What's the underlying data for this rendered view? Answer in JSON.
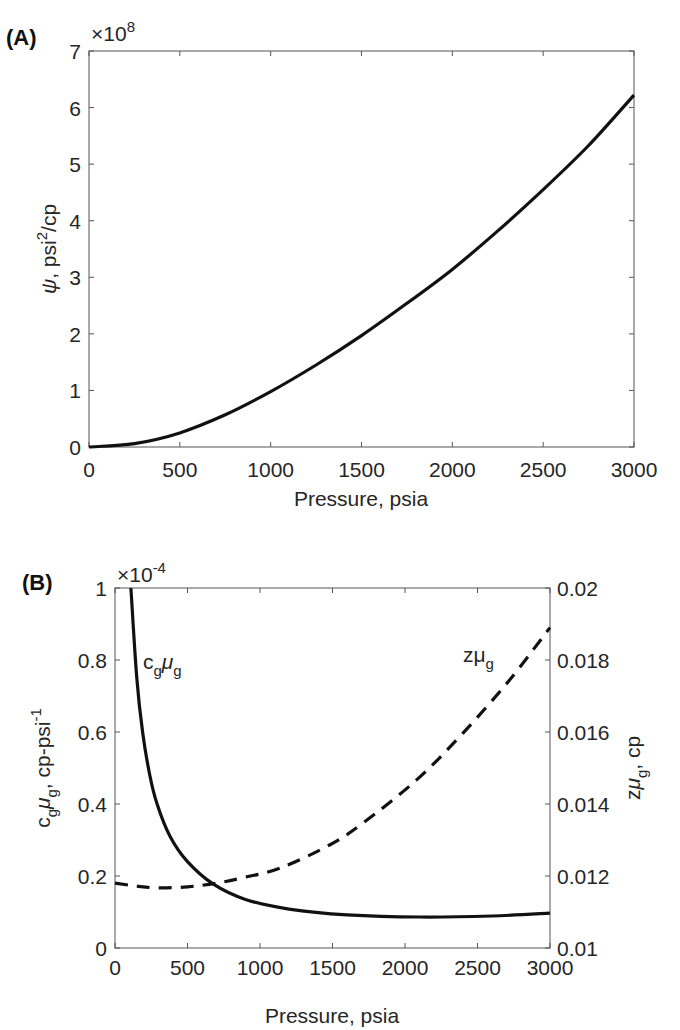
{
  "panels": {
    "A": {
      "label": "(A)",
      "exponent": "×10",
      "exponent_power": "8",
      "xlabel": "Pressure, psia",
      "ylabel_symbol": "ψ",
      "ylabel_rest": ", psi",
      "ylabel_sup": "2",
      "ylabel_tail": "/cp"
    },
    "B": {
      "label": "(B)",
      "exponent": "×10",
      "exponent_power": "-4",
      "xlabel": "Pressure, psia",
      "left_ylabel": "c_gμ_g, cp-psi^-1",
      "right_ylabel": "zμ_g, cp",
      "curve_label_solid": "c",
      "curve_label_solid_sub": "g",
      "curve_label_mu": "μ",
      "curve_label_dashed": "zμ",
      "sub_g": "g"
    }
  },
  "chart_data": [
    {
      "type": "line",
      "title": "(A)",
      "xlabel": "Pressure, psia",
      "ylabel": "ψ, psi^2/cp",
      "y_multiplier": "x10^8",
      "xlim": [
        0,
        3000
      ],
      "ylim": [
        0,
        7
      ],
      "xticks": [
        0,
        500,
        1000,
        1500,
        2000,
        2500,
        3000
      ],
      "yticks": [
        0,
        1,
        2,
        3,
        4,
        5,
        6,
        7
      ],
      "grid": false,
      "series": [
        {
          "name": "psi",
          "style": "solid",
          "x": [
            0,
            250,
            500,
            750,
            1000,
            1250,
            1500,
            1750,
            2000,
            2250,
            2500,
            2750,
            3000
          ],
          "y": [
            0,
            0.06,
            0.25,
            0.57,
            0.98,
            1.45,
            1.97,
            2.54,
            3.14,
            3.82,
            4.55,
            5.33,
            6.22
          ]
        }
      ]
    },
    {
      "type": "line",
      "title": "(B)",
      "xlabel": "Pressure, psia",
      "ylabel": "c_gμ_g, cp-psi^-1",
      "y_multiplier": "x10^-4",
      "ylabel_right": "zμ_g, cp",
      "xlim": [
        0,
        3000
      ],
      "ylim": [
        0,
        1
      ],
      "ylim_right": [
        0.01,
        0.02
      ],
      "xticks": [
        0,
        500,
        1000,
        1500,
        2000,
        2500,
        3000
      ],
      "yticks": [
        0,
        0.2,
        0.4,
        0.6,
        0.8,
        1
      ],
      "yticks_right": [
        0.01,
        0.012,
        0.014,
        0.016,
        0.018,
        0.02
      ],
      "grid": false,
      "annotations": [
        "c_gμ_g",
        "zμ_g"
      ],
      "series": [
        {
          "name": "c_gμ_g",
          "axis": "left",
          "style": "solid",
          "x": [
            110,
            150,
            190,
            240,
            290,
            380,
            500,
            676,
            900,
            1200,
            1600,
            2100,
            2600,
            3000
          ],
          "y": [
            1.0,
            0.75,
            0.6,
            0.48,
            0.4,
            0.31,
            0.24,
            0.178,
            0.135,
            0.108,
            0.092,
            0.086,
            0.089,
            0.097
          ]
        },
        {
          "name": "zμ_g",
          "axis": "right",
          "style": "dashed",
          "x": [
            0,
            150,
            300,
            500,
            700,
            900,
            1140,
            1480,
            1710,
            2080,
            2400,
            2720,
            3000
          ],
          "y": [
            0.0118,
            0.01172,
            0.01167,
            0.0117,
            0.0118,
            0.01197,
            0.01222,
            0.01286,
            0.01347,
            0.01467,
            0.01597,
            0.01744,
            0.0189
          ]
        }
      ]
    }
  ]
}
